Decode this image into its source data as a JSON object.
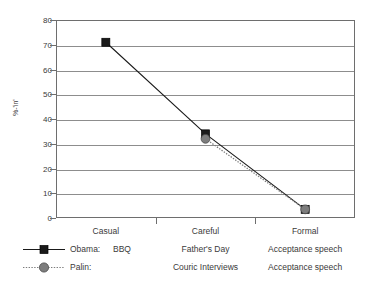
{
  "chart_data": {
    "type": "line",
    "title": "",
    "xlabel": "",
    "ylabel": "%-'in'",
    "categories": [
      "Casual",
      "Careful",
      "Formal"
    ],
    "ylim": [
      0,
      80
    ],
    "ytick_step": 10,
    "yticks": [
      80,
      70,
      60,
      50,
      40,
      30,
      20,
      10,
      0
    ],
    "grid": "horizontal",
    "legend_position": "bottom-left",
    "series": [
      {
        "name": "Obama:",
        "values": [
          71,
          34,
          3.5
        ],
        "line_style": "solid",
        "marker": "square",
        "color": "#1a1a1a"
      },
      {
        "name": "Palin:",
        "values": [
          null,
          32,
          3.5
        ],
        "line_style": "dotted",
        "marker": "circle",
        "color": "#7d7d7d"
      }
    ],
    "legend_table": {
      "columns": [
        "Casual",
        "Careful",
        "Formal"
      ],
      "rows": [
        {
          "series": "Obama:",
          "cells": [
            "BBQ",
            "Father's Day",
            "Acceptance speech"
          ]
        },
        {
          "series": "Palin:",
          "cells": [
            "",
            "Couric Interviews",
            "Acceptance speech"
          ]
        }
      ]
    },
    "colors": {
      "obama": "#1a1a1a",
      "palin": "#7d7d7d",
      "grid": "#8d8d8d",
      "axis": "#6e6e6e",
      "text": "#3a3a3a",
      "background": "#ffffff"
    }
  }
}
